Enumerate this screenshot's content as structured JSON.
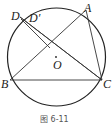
{
  "figure": {
    "caption": "图 6-11",
    "center_label": "O",
    "points": {
      "A": {
        "label": "A"
      },
      "B": {
        "label": "B"
      },
      "C": {
        "label": "C"
      },
      "D": {
        "label": "D"
      },
      "D_prime": {
        "label": "D′"
      }
    },
    "stroke_color": "#222222"
  }
}
